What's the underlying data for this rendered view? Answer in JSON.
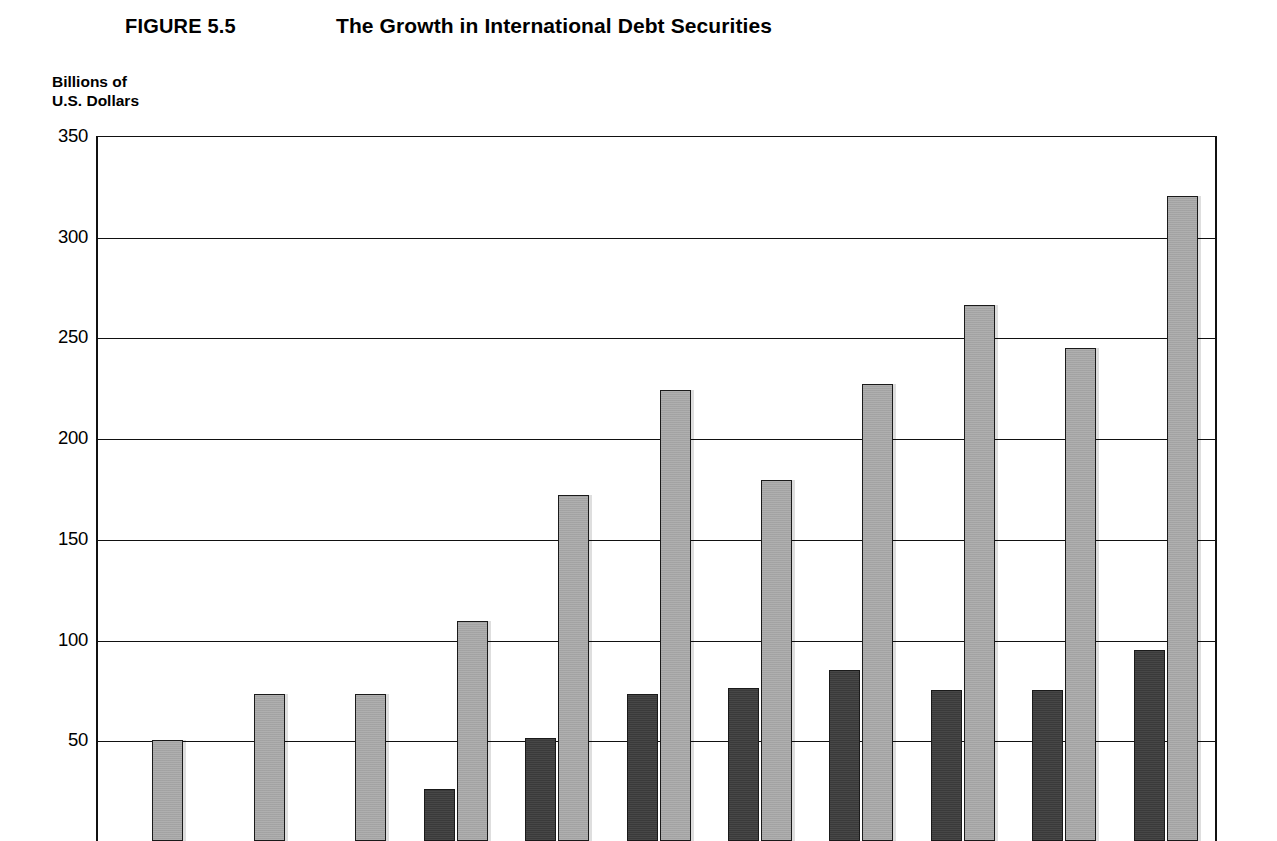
{
  "figure": {
    "label": "FIGURE 5.5",
    "title": "The Growth in International Debt Securities"
  },
  "axis_caption": {
    "line1": "Billions of",
    "line2": "U.S. Dollars"
  },
  "colors": {
    "dark_series": "#3d3d3d",
    "light_series": "#ababab",
    "axis": "#111111",
    "background": "#ffffff"
  },
  "chart_data": {
    "type": "bar",
    "title": "The Growth in International Debt Securities",
    "subtitle": "FIGURE 5.5",
    "xlabel": "",
    "ylabel": "Billions of U.S. Dollars",
    "ylim": [
      0,
      350
    ],
    "yticks": [
      50,
      100,
      150,
      200,
      250,
      300,
      350
    ],
    "ytick_labels": [
      "50",
      "100",
      "150",
      "200",
      "250",
      "300",
      "350"
    ],
    "grid": true,
    "legend": "none",
    "categories": [
      "1",
      "2",
      "3",
      "4",
      "5",
      "6",
      "7",
      "8",
      "9",
      "10",
      "11"
    ],
    "series": [
      {
        "name": "dark",
        "color": "#3d3d3d",
        "values": [
          0,
          0,
          0,
          26,
          51,
          73,
          76,
          85,
          75,
          75,
          95
        ]
      },
      {
        "name": "light",
        "color": "#ababab",
        "values": [
          50,
          73,
          73,
          109,
          172,
          224,
          179,
          227,
          266,
          245,
          320
        ]
      }
    ]
  }
}
